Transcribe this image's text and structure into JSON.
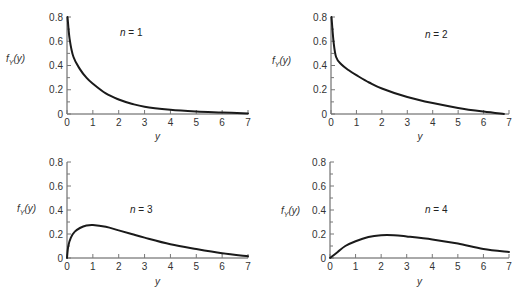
{
  "chart_data": [
    {
      "type": "line",
      "title": "",
      "annotation": "n = 1",
      "xlabel": "y",
      "ylabel": "f_Y(y)",
      "xlim": [
        0,
        7
      ],
      "ylim": [
        0,
        0.8
      ],
      "xticks": [
        "0",
        "1",
        "2",
        "3",
        "4",
        "5",
        "6",
        "7"
      ],
      "yticks": [
        "0",
        "0.2",
        "0.4",
        "0.6",
        "0.8"
      ],
      "grid": false,
      "series": [
        {
          "name": "n = 1",
          "x": [
            0.02,
            0.1,
            0.25,
            0.5,
            0.75,
            1,
            1.5,
            2,
            2.5,
            3,
            4,
            5,
            6,
            7
          ],
          "y": [
            0.8,
            0.62,
            0.47,
            0.37,
            0.3,
            0.25,
            0.17,
            0.12,
            0.085,
            0.06,
            0.035,
            0.02,
            0.012,
            0.005
          ]
        }
      ]
    },
    {
      "type": "line",
      "title": "",
      "annotation": "n = 2",
      "xlabel": "y",
      "ylabel": "f_Y(y)",
      "xlim": [
        0,
        7
      ],
      "ylim": [
        0,
        0.8
      ],
      "xticks": [
        "0",
        "1",
        "2",
        "3",
        "4",
        "5",
        "6",
        "7"
      ],
      "yticks": [
        "0",
        "0.2",
        "0.4",
        "0.6",
        "0.8"
      ],
      "grid": false,
      "series": [
        {
          "name": "n = 2",
          "x": [
            0.02,
            0.1,
            0.2,
            0.4,
            0.7,
            1,
            1.5,
            2,
            3,
            4,
            5,
            6,
            6.8
          ],
          "y": [
            0.8,
            0.6,
            0.47,
            0.41,
            0.36,
            0.32,
            0.26,
            0.21,
            0.14,
            0.09,
            0.05,
            0.02,
            0.0
          ]
        }
      ]
    },
    {
      "type": "line",
      "title": "",
      "annotation": "n = 3",
      "xlabel": "y",
      "ylabel": "f_Y(y)",
      "xlim": [
        0,
        7
      ],
      "ylim": [
        0,
        0.8
      ],
      "xticks": [
        "0",
        "1",
        "2",
        "3",
        "4",
        "5",
        "6",
        "7"
      ],
      "yticks": [
        "0",
        "0.2",
        "0.4",
        "0.6",
        "0.8"
      ],
      "grid": false,
      "series": [
        {
          "name": "n = 3",
          "x": [
            0,
            0.05,
            0.15,
            0.3,
            0.5,
            0.75,
            1,
            1.5,
            2,
            2.5,
            3,
            4,
            5,
            6,
            7
          ],
          "y": [
            0,
            0.1,
            0.17,
            0.22,
            0.25,
            0.27,
            0.275,
            0.26,
            0.23,
            0.2,
            0.17,
            0.115,
            0.075,
            0.04,
            0.015
          ]
        }
      ]
    },
    {
      "type": "line",
      "title": "",
      "annotation": "n = 4",
      "xlabel": "y",
      "ylabel": "f_Y(y)",
      "xlim": [
        0,
        7
      ],
      "ylim": [
        0,
        0.8
      ],
      "xticks": [
        "0",
        "1",
        "2",
        "3",
        "4",
        "5",
        "6",
        "7"
      ],
      "yticks": [
        "0",
        "0.2",
        "0.4",
        "0.6",
        "0.8"
      ],
      "grid": false,
      "series": [
        {
          "name": "n = 4",
          "x": [
            0,
            0.3,
            0.6,
            1,
            1.5,
            2,
            2.5,
            3,
            4,
            5,
            6,
            7
          ],
          "y": [
            0,
            0.05,
            0.1,
            0.14,
            0.175,
            0.19,
            0.19,
            0.18,
            0.155,
            0.12,
            0.075,
            0.05
          ]
        }
      ]
    }
  ],
  "layout": {
    "panels": [
      {
        "x0": 67,
        "x7": 248,
        "y0": 114,
        "ytop": 17,
        "ann_x": 120,
        "ann_y": 36,
        "ylabel_x": 6,
        "ylabel_y": 62,
        "xlabel_y": 140
      },
      {
        "x0": 331,
        "x7": 509,
        "y0": 114,
        "ytop": 17,
        "ann_x": 425,
        "ann_y": 38,
        "ylabel_x": 272,
        "ylabel_y": 64,
        "xlabel_y": 140
      },
      {
        "x0": 67,
        "x7": 248,
        "y0": 258,
        "ytop": 162,
        "ann_x": 130,
        "ann_y": 213,
        "ylabel_x": 17,
        "ylabel_y": 212,
        "xlabel_y": 285
      },
      {
        "x0": 330,
        "x7": 509,
        "y0": 258,
        "ytop": 162,
        "ann_x": 425,
        "ann_y": 213,
        "ylabel_x": 281,
        "ylabel_y": 214,
        "xlabel_y": 285
      }
    ],
    "curve_color": "#1a1a1a",
    "axis_color": "#555555"
  }
}
